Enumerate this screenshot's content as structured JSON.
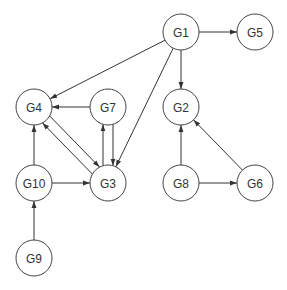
{
  "diagram": {
    "type": "directed-graph",
    "node_radius": 18,
    "colors": {
      "stroke": "#444444",
      "fill": "#ffffff",
      "text": "#333333"
    },
    "nodes": [
      {
        "id": "G1",
        "label": "G1",
        "x": 181,
        "y": 32
      },
      {
        "id": "G5",
        "label": "G5",
        "x": 255,
        "y": 32
      },
      {
        "id": "G2",
        "label": "G2",
        "x": 181,
        "y": 107
      },
      {
        "id": "G4",
        "label": "G4",
        "x": 34,
        "y": 107
      },
      {
        "id": "G7",
        "label": "G7",
        "x": 108,
        "y": 107
      },
      {
        "id": "G10",
        "label": "G10",
        "x": 34,
        "y": 183
      },
      {
        "id": "G3",
        "label": "G3",
        "x": 108,
        "y": 183
      },
      {
        "id": "G8",
        "label": "G8",
        "x": 181,
        "y": 183
      },
      {
        "id": "G6",
        "label": "G6",
        "x": 255,
        "y": 183
      },
      {
        "id": "G9",
        "label": "G9",
        "x": 34,
        "y": 258
      }
    ],
    "edges": [
      {
        "from": "G1",
        "to": "G5",
        "offset": 0
      },
      {
        "from": "G1",
        "to": "G2",
        "offset": 0
      },
      {
        "from": "G1",
        "to": "G4",
        "offset": 0
      },
      {
        "from": "G1",
        "to": "G3",
        "offset": 0
      },
      {
        "from": "G7",
        "to": "G4",
        "offset": 0
      },
      {
        "from": "G7",
        "to": "G3",
        "offset": -5
      },
      {
        "from": "G3",
        "to": "G7",
        "offset": -5
      },
      {
        "from": "G4",
        "to": "G3",
        "offset": -5
      },
      {
        "from": "G3",
        "to": "G4",
        "offset": -5
      },
      {
        "from": "G10",
        "to": "G4",
        "offset": 0
      },
      {
        "from": "G10",
        "to": "G3",
        "offset": 0
      },
      {
        "from": "G9",
        "to": "G10",
        "offset": 0
      },
      {
        "from": "G8",
        "to": "G2",
        "offset": 0
      },
      {
        "from": "G8",
        "to": "G6",
        "offset": 0
      },
      {
        "from": "G6",
        "to": "G2",
        "offset": 0
      }
    ]
  }
}
